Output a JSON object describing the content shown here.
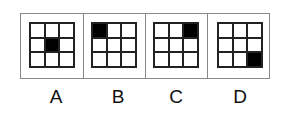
{
  "options": [
    {
      "label": "A",
      "filled_cell": [
        1,
        1
      ]
    },
    {
      "label": "B",
      "filled_cell": [
        0,
        0
      ]
    },
    {
      "label": "C",
      "filled_cell": [
        0,
        2
      ]
    },
    {
      "label": "D",
      "filled_cell": [
        2,
        2
      ]
    }
  ],
  "grid_size": 3,
  "colors": {
    "filled": "#000000",
    "empty": "#ffffff",
    "line": "#222222",
    "frame": "#888888"
  }
}
